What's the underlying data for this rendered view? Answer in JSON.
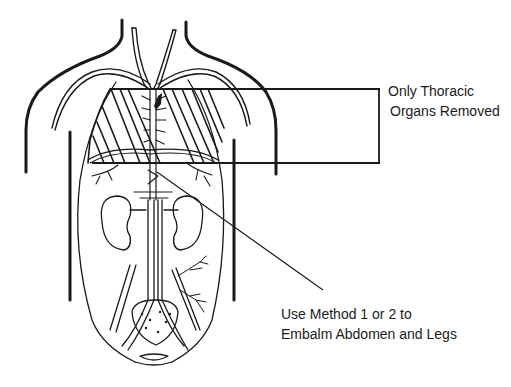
{
  "figure": {
    "colors": {
      "ink": "#1a1a1a",
      "background": "#ffffff"
    }
  },
  "annotations": {
    "thoracic_label": {
      "line1": "Only Thoracic",
      "line2": "Organs Removed"
    },
    "abdomen_label": {
      "line1": "Use Method 1 or 2 to",
      "line2": "Embalm Abdomen and Legs"
    }
  }
}
